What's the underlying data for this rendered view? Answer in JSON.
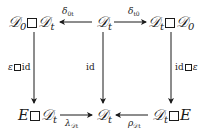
{
  "diagram": {
    "type": "commutative-diagram",
    "nodes": {
      "top_left": {
        "a": "𝒟",
        "a_sub": "0",
        "b": "𝒟",
        "b_sub": "t"
      },
      "top_center": {
        "a": "𝒟",
        "a_sub": "t"
      },
      "top_right": {
        "a": "𝒟",
        "a_sub": "t",
        "b": "𝒟",
        "b_sub": "0"
      },
      "bottom_left": {
        "a": "E",
        "b": "𝒟",
        "b_sub": "t"
      },
      "bottom_center": {
        "a": "𝒟",
        "a_sub": "t"
      },
      "bottom_right": {
        "a": "𝒟",
        "a_sub": "t",
        "b": "E"
      }
    },
    "arrows": {
      "top_left": {
        "sym": "δ",
        "sub": "0t",
        "from": "top_center",
        "to": "top_left"
      },
      "top_right": {
        "sym": "δ",
        "sub": "t0",
        "from": "top_center",
        "to": "top_right"
      },
      "left_vertical": {
        "pre": "ε",
        "post": "id",
        "from": "top_left",
        "to": "bottom_left"
      },
      "center_vertical": {
        "label": "id",
        "from": "top_center",
        "to": "bottom_center"
      },
      "right_vertical": {
        "pre": "id",
        "post": "ε",
        "from": "top_right",
        "to": "bottom_right"
      },
      "bottom_left": {
        "sym": "λ",
        "sub": "𝒟t",
        "from": "bottom_left",
        "to": "bottom_center"
      },
      "bottom_right": {
        "sym": "ρ",
        "sub": "𝒟t",
        "from": "bottom_right",
        "to": "bottom_center"
      }
    }
  }
}
